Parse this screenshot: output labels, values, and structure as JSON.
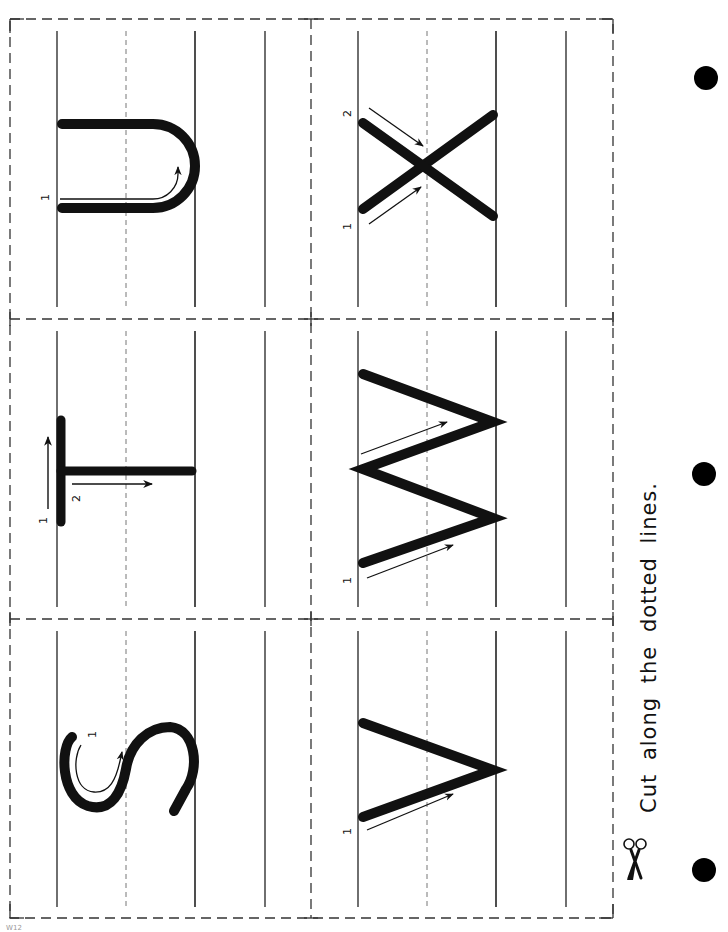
{
  "worksheet": {
    "instruction": "Cut along the dotted lines.",
    "page_code": "W12",
    "colors": {
      "ink": "#111111",
      "guide": "#222222",
      "dash": "#555555",
      "paper": "#ffffff"
    },
    "orientation": "rotated-90-clockwise",
    "cards": [
      {
        "letter": "U",
        "stroke_numbers": [
          "1"
        ],
        "row": 0,
        "col": 0
      },
      {
        "letter": "X",
        "stroke_numbers": [
          "1",
          "2"
        ],
        "row": 0,
        "col": 1
      },
      {
        "letter": "T",
        "stroke_numbers": [
          "1",
          "2"
        ],
        "row": 1,
        "col": 0
      },
      {
        "letter": "W",
        "stroke_numbers": [
          "1"
        ],
        "row": 1,
        "col": 1
      },
      {
        "letter": "S",
        "stroke_numbers": [
          "1"
        ],
        "row": 2,
        "col": 0
      },
      {
        "letter": "V",
        "stroke_numbers": [
          "1"
        ],
        "row": 2,
        "col": 1
      }
    ],
    "binder_holes": 3,
    "icons": [
      "scissors-icon",
      "binder-hole-icon"
    ]
  }
}
